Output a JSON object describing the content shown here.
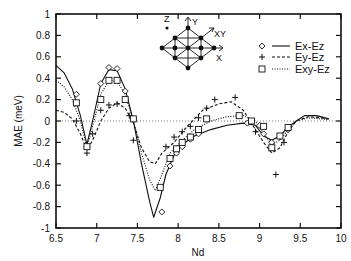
{
  "chart_data": {
    "type": "line",
    "title": "",
    "xlabel": "Nd",
    "ylabel": "MAE (meV)",
    "xlim": [
      6.5,
      10
    ],
    "ylim": [
      -1,
      1
    ],
    "xticks": [
      6.5,
      7,
      7.5,
      8,
      8.5,
      9,
      9.5,
      10
    ],
    "xtick_labels": [
      "6.5",
      "7",
      "7.5",
      "8",
      "8.5",
      "9",
      "9.5",
      "10"
    ],
    "yticks": [
      -1,
      -0.8,
      -0.6,
      -0.4,
      -0.2,
      0,
      0.2,
      0.4,
      0.6,
      0.8,
      1
    ],
    "ytick_labels": [
      "-1",
      "-0.8",
      "-0.6",
      "-0.4",
      "-0.2",
      "0",
      "0.2",
      "0.4",
      "0.6",
      "0.8",
      "1"
    ],
    "grid": false,
    "zero_line": {
      "y": 0,
      "style": "dotted"
    },
    "legend": {
      "position": "upper right",
      "entries": [
        {
          "label": "Ex-Ez",
          "marker": "diamond",
          "line": "solid"
        },
        {
          "label": "Ey-Ez",
          "marker": "plus",
          "line": "dashed"
        },
        {
          "label": "Exy-Ez",
          "marker": "square",
          "line": "dotted"
        }
      ]
    },
    "inset": {
      "description": "square lattice with axis arrows",
      "labels": [
        "Z",
        "Y",
        "XY",
        "X"
      ]
    },
    "series": [
      {
        "name": "Ex-Ez",
        "marker": "diamond",
        "line": "solid",
        "curve": [
          [
            6.5,
            0.52
          ],
          [
            6.6,
            0.45
          ],
          [
            6.7,
            0.3
          ],
          [
            6.8,
            0.05
          ],
          [
            6.88,
            -0.22
          ],
          [
            6.95,
            0.0
          ],
          [
            7.05,
            0.35
          ],
          [
            7.15,
            0.48
          ],
          [
            7.25,
            0.47
          ],
          [
            7.35,
            0.3
          ],
          [
            7.45,
            0.0
          ],
          [
            7.55,
            -0.4
          ],
          [
            7.65,
            -0.75
          ],
          [
            7.7,
            -0.9
          ],
          [
            7.78,
            -0.72
          ],
          [
            7.85,
            -0.5
          ],
          [
            7.95,
            -0.32
          ],
          [
            8.05,
            -0.22
          ],
          [
            8.2,
            -0.14
          ],
          [
            8.4,
            -0.08
          ],
          [
            8.6,
            -0.04
          ],
          [
            8.8,
            -0.02
          ],
          [
            8.95,
            -0.04
          ],
          [
            9.05,
            -0.14
          ],
          [
            9.15,
            -0.18
          ],
          [
            9.25,
            -0.14
          ],
          [
            9.35,
            -0.06
          ],
          [
            9.45,
            0.0
          ],
          [
            9.55,
            0.05
          ],
          [
            9.7,
            0.05
          ],
          [
            9.85,
            0.02
          ]
        ],
        "points": [
          [
            6.75,
            0.25
          ],
          [
            6.88,
            -0.24
          ],
          [
            7.05,
            0.35
          ],
          [
            7.15,
            0.5
          ],
          [
            7.25,
            0.49
          ],
          [
            7.35,
            0.28
          ],
          [
            7.45,
            0.02
          ],
          [
            7.8,
            -0.85
          ],
          [
            7.9,
            -0.42
          ],
          [
            7.98,
            -0.3
          ],
          [
            8.05,
            -0.24
          ],
          [
            8.15,
            -0.17
          ],
          [
            8.25,
            -0.12
          ],
          [
            8.85,
            -0.02
          ],
          [
            9.0,
            -0.04
          ],
          [
            9.05,
            -0.12
          ],
          [
            9.15,
            -0.2
          ],
          [
            9.25,
            -0.15
          ],
          [
            9.35,
            -0.08
          ]
        ]
      },
      {
        "name": "Ey-Ez",
        "marker": "plus",
        "line": "dashed",
        "curve": [
          [
            6.5,
            0.1
          ],
          [
            6.6,
            0.08
          ],
          [
            6.7,
            0.02
          ],
          [
            6.8,
            -0.12
          ],
          [
            6.88,
            -0.27
          ],
          [
            6.95,
            -0.18
          ],
          [
            7.05,
            0.0
          ],
          [
            7.15,
            0.12
          ],
          [
            7.25,
            0.17
          ],
          [
            7.35,
            0.12
          ],
          [
            7.45,
            -0.02
          ],
          [
            7.55,
            -0.25
          ],
          [
            7.65,
            -0.38
          ],
          [
            7.72,
            -0.4
          ],
          [
            7.8,
            -0.3
          ],
          [
            7.95,
            -0.2
          ],
          [
            8.1,
            -0.06
          ],
          [
            8.3,
            0.1
          ],
          [
            8.5,
            0.16
          ],
          [
            8.65,
            0.18
          ],
          [
            8.8,
            0.1
          ],
          [
            8.95,
            -0.08
          ],
          [
            9.05,
            -0.2
          ],
          [
            9.15,
            -0.3
          ],
          [
            9.25,
            -0.25
          ],
          [
            9.35,
            -0.1
          ],
          [
            9.45,
            0.0
          ],
          [
            9.6,
            0.04
          ],
          [
            9.75,
            0.03
          ],
          [
            9.85,
            0.02
          ]
        ],
        "points": [
          [
            6.75,
            0.0
          ],
          [
            6.88,
            -0.3
          ],
          [
            6.95,
            -0.12
          ],
          [
            7.05,
            0.1
          ],
          [
            7.15,
            0.15
          ],
          [
            7.25,
            0.16
          ],
          [
            7.4,
            0.05
          ],
          [
            7.45,
            -0.18
          ],
          [
            7.85,
            -0.24
          ],
          [
            7.95,
            -0.15
          ],
          [
            8.05,
            -0.1
          ],
          [
            8.15,
            -0.05
          ],
          [
            8.25,
            0.03
          ],
          [
            8.35,
            0.12
          ],
          [
            8.45,
            0.2
          ],
          [
            8.7,
            0.22
          ],
          [
            8.95,
            -0.1
          ],
          [
            9.2,
            -0.5
          ],
          [
            9.3,
            -0.2
          ]
        ]
      },
      {
        "name": "Exy-Ez",
        "marker": "square",
        "line": "dotted",
        "curve": [
          [
            6.5,
            0.38
          ],
          [
            6.6,
            0.32
          ],
          [
            6.7,
            0.2
          ],
          [
            6.8,
            0.0
          ],
          [
            6.88,
            -0.25
          ],
          [
            6.95,
            -0.05
          ],
          [
            7.05,
            0.25
          ],
          [
            7.15,
            0.38
          ],
          [
            7.25,
            0.37
          ],
          [
            7.35,
            0.25
          ],
          [
            7.45,
            0.0
          ],
          [
            7.55,
            -0.3
          ],
          [
            7.65,
            -0.55
          ],
          [
            7.72,
            -0.65
          ],
          [
            7.8,
            -0.5
          ],
          [
            7.9,
            -0.3
          ],
          [
            8.05,
            -0.18
          ],
          [
            8.2,
            -0.08
          ],
          [
            8.4,
            0.0
          ],
          [
            8.6,
            0.04
          ],
          [
            8.8,
            0.05
          ],
          [
            8.95,
            0.0
          ],
          [
            9.05,
            -0.12
          ],
          [
            9.15,
            -0.22
          ],
          [
            9.25,
            -0.18
          ],
          [
            9.35,
            -0.08
          ],
          [
            9.45,
            0.0
          ],
          [
            9.6,
            0.03
          ],
          [
            9.75,
            0.02
          ],
          [
            9.85,
            0.01
          ]
        ],
        "points": [
          [
            6.75,
            0.17
          ],
          [
            6.88,
            -0.24
          ],
          [
            7.05,
            0.2
          ],
          [
            7.15,
            0.38
          ],
          [
            7.25,
            0.38
          ],
          [
            7.35,
            0.2
          ],
          [
            7.45,
            0.02
          ],
          [
            7.78,
            -0.62
          ],
          [
            7.9,
            -0.35
          ],
          [
            7.98,
            -0.26
          ],
          [
            8.05,
            -0.2
          ],
          [
            8.15,
            -0.15
          ],
          [
            8.25,
            -0.08
          ],
          [
            8.35,
            0.02
          ],
          [
            8.75,
            0.05
          ],
          [
            8.9,
            0.0
          ],
          [
            9.05,
            -0.05
          ],
          [
            9.15,
            -0.25
          ],
          [
            9.25,
            -0.14
          ],
          [
            9.35,
            -0.06
          ]
        ]
      }
    ]
  },
  "labels": {
    "xlabel": "Nd",
    "ylabel": "MAE (meV)",
    "legend": [
      "Ex-Ez",
      "Ey-Ez",
      "Exy-Ez"
    ],
    "inset": {
      "z": "Z",
      "y": "Y",
      "xy": "XY",
      "x": "X"
    }
  }
}
